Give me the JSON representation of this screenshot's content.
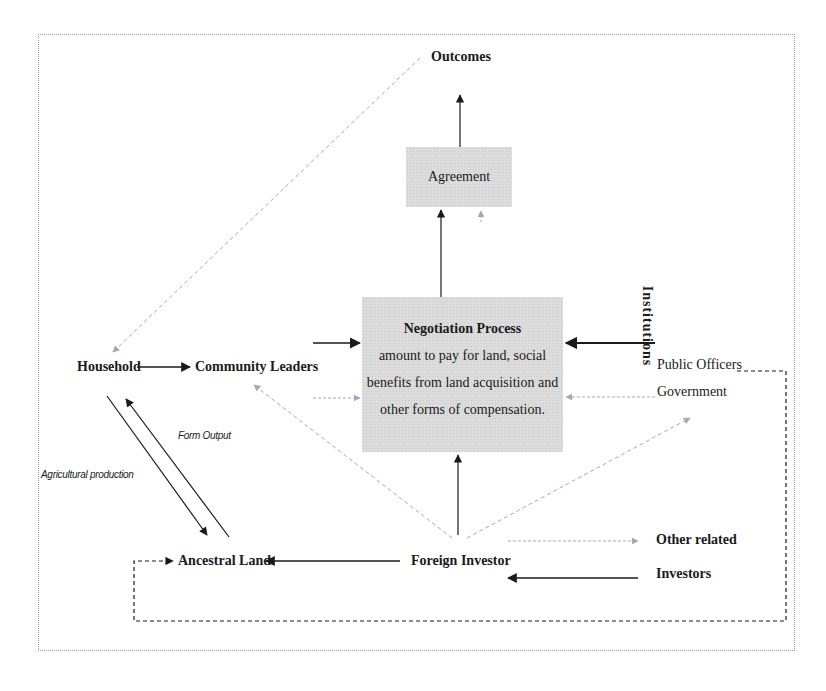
{
  "diagram": {
    "nodes": {
      "outcomes": "Outcomes",
      "agreement": "Agreement",
      "negotiation_title": "Negotiation Process",
      "negotiation_line1": "amount to pay for land, social",
      "negotiation_line2": "benefits from land acquisition and",
      "negotiation_line3": "other forms of compensation.",
      "household": "Household",
      "community_leaders": "Community Leaders",
      "institutions": "Institutions",
      "public_officers": "Public Officers",
      "government": "Government",
      "ancestral_land": "Ancestral Land",
      "foreign_investor": "Foreign Investor",
      "other_related": "Other related",
      "investors": "Investors"
    },
    "edge_labels": {
      "form_output": "Form Output",
      "agricultural_production": "Agricultural production"
    },
    "edges": [
      {
        "from": "Agreement",
        "to": "Outcomes",
        "style": "solid"
      },
      {
        "from": "Negotiation Process",
        "to": "Agreement",
        "style": "solid"
      },
      {
        "from": "Outcomes",
        "to": "Household",
        "style": "dashed-gray"
      },
      {
        "from": "Household",
        "to": "Community Leaders",
        "style": "solid"
      },
      {
        "from": "Community Leaders",
        "to": "Negotiation Process",
        "style": "solid"
      },
      {
        "from": "Community Leaders",
        "to": "Negotiation Process",
        "style": "dashed-gray"
      },
      {
        "from": "Institutions",
        "to": "Negotiation Process",
        "style": "solid"
      },
      {
        "from": "Public Officers Government",
        "to": "Negotiation Process",
        "style": "dashed-gray"
      },
      {
        "from": "Foreign Investor",
        "to": "Negotiation Process",
        "style": "solid"
      },
      {
        "from": "Foreign Investor",
        "to": "Community Leaders",
        "style": "dashed-gray"
      },
      {
        "from": "Foreign Investor",
        "to": "Public Officers Government",
        "style": "dashed-gray"
      },
      {
        "from": "Foreign Investor",
        "to": "Other related Investors",
        "style": "dashed-gray"
      },
      {
        "from": "Foreign Investor",
        "to": "Ancestral Land",
        "style": "solid"
      },
      {
        "from": "Other related Investors",
        "to": "Foreign Investor",
        "style": "solid"
      },
      {
        "from": "Ancestral Land",
        "to": "Household",
        "style": "solid",
        "label": "Form Output"
      },
      {
        "from": "Household",
        "to": "Ancestral Land",
        "style": "solid",
        "label": "Agricultural production"
      },
      {
        "from": "Public Officers Government",
        "to": "Ancestral Land",
        "style": "dashed-black"
      }
    ],
    "colors": {
      "box_fill": "#dcdcdc",
      "solid_line": "#1a1a1a",
      "dashed_gray": "#9a9a9a",
      "frame": "#9a9a9a"
    }
  }
}
